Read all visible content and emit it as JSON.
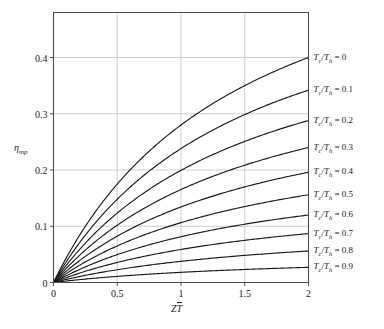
{
  "chart_data": {
    "type": "line",
    "title": "",
    "xlabel": "ZT̄",
    "ylabel": "ηmp",
    "xlabel_parts": {
      "symbol": "Z",
      "barred": "T"
    },
    "ylabel_parts": {
      "symbol": "η",
      "subscript": "mp"
    },
    "xlim": [
      0,
      2
    ],
    "ylim": [
      0,
      0.48
    ],
    "xticks": [
      0,
      0.5,
      1,
      1.5,
      2
    ],
    "xticklabels": [
      "0",
      "0.5",
      "1",
      "1.5",
      "2"
    ],
    "yticks": [
      0,
      0.1,
      0.2,
      0.3,
      0.4
    ],
    "yticklabels": [
      "0",
      "0.1",
      "0.2",
      "0.3",
      "0.4"
    ],
    "grid": true,
    "grid_color": "#c8c8c8",
    "axis_color": "#4d4d4d",
    "line_color": "#1a1a1a",
    "background": "#ffffff",
    "legend_position": "right-of-axes-at-curve-end",
    "x": [
      0,
      0.05,
      0.1,
      0.15,
      0.2,
      0.25,
      0.3,
      0.4,
      0.5,
      0.6,
      0.7,
      0.8,
      0.9,
      1.0,
      1.1,
      1.2,
      1.3,
      1.4,
      1.5,
      1.6,
      1.7,
      1.8,
      1.9,
      2.0
    ],
    "series": [
      {
        "name": "Tc/Th = 0",
        "ratio": 0,
        "label": "T<sub>c</sub>/T<sub>h</sub> = 0",
        "label_value": "0",
        "values": [
          0,
          0.01,
          0.0196,
          0.0288,
          0.0377,
          0.0463,
          0.0545,
          0.0702,
          0.0848,
          0.0984,
          0.1111,
          0.1231,
          0.1343,
          0.1449,
          0.1549,
          0.1644,
          0.1734,
          0.1819,
          0.19,
          0.1977,
          0.2051,
          0.2121,
          0.2189,
          0.2253
        ],
        "endpoint": 0.4
      },
      {
        "name": "Tc/Th = 0.1",
        "ratio": 0.1,
        "label": "T<sub>c</sub>/T<sub>h</sub> = 0.1",
        "label_value": "0.1",
        "endpoint": 0.342
      },
      {
        "name": "Tc/Th = 0.2",
        "ratio": 0.2,
        "label": "T<sub>c</sub>/T<sub>h</sub> = 0.2",
        "label_value": "0.2",
        "endpoint": 0.288
      },
      {
        "name": "Tc/Th = 0.3",
        "ratio": 0.3,
        "label": "T<sub>c</sub>/T<sub>h</sub> = 0.3",
        "label_value": "0.3",
        "endpoint": 0.24
      },
      {
        "name": "Tc/Th = 0.4",
        "ratio": 0.4,
        "label": "T<sub>c</sub>/T<sub>h</sub> = 0.4",
        "label_value": "0.4",
        "endpoint": 0.196
      },
      {
        "name": "Tc/Th = 0.5",
        "ratio": 0.5,
        "label": "T<sub>c</sub>/T<sub>h</sub> = 0.5",
        "label_value": "0.5",
        "endpoint": 0.156
      },
      {
        "name": "Tc/Th = 0.6",
        "ratio": 0.6,
        "label": "T<sub>c</sub>/T<sub>h</sub> = 0.6",
        "label_value": "0.6",
        "endpoint": 0.12
      },
      {
        "name": "Tc/Th = 0.7",
        "ratio": 0.7,
        "label": "T<sub>c</sub>/T<sub>h</sub> = 0.7",
        "label_value": "0.7",
        "endpoint": 0.087
      },
      {
        "name": "Tc/Th = 0.8",
        "ratio": 0.8,
        "label": "T<sub>c</sub>/T<sub>h</sub> = 0.8",
        "label_value": "0.8",
        "endpoint": 0.056
      },
      {
        "name": "Tc/Th = 0.9",
        "ratio": 0.9,
        "label": "T<sub>c</sub>/T<sub>h</sub> = 0.9",
        "label_value": "0.9",
        "endpoint": 0.027
      }
    ]
  }
}
